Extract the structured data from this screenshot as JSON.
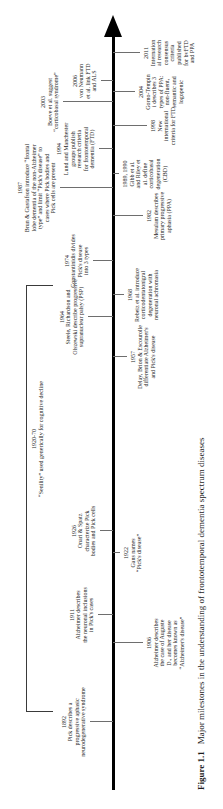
{
  "figure": {
    "caption_label": "Figure 1.1",
    "caption_text": "Major milestones in the understanding of frontotemporal dementia spectrum diseases"
  },
  "timeline": {
    "type": "timeline",
    "orientation": "vertical-arrow-up (horizontal figure rotated 90° counterclockwise)",
    "axis_color": "#000000",
    "tick_color": "#6e6e6e",
    "text_color": "#1c1c1c",
    "background_color": "#ffffff",
    "year_min": "1892",
    "year_max": "2011",
    "era": {
      "year_range": "1920-70",
      "lines": [
        "1920-70",
        "“Senility” used generically for cognitive decline"
      ],
      "bracket_x_start": 97,
      "bracket_x_end": 522,
      "label_x": 370
    },
    "events": [
      {
        "year": "1892",
        "side": "above",
        "x": 87,
        "tick": 23,
        "lines": [
          "Pick describes a",
          "progressive aphasic",
          "neurodegenerative syndrome"
        ]
      },
      {
        "year": "1906",
        "side": "below",
        "x": 166,
        "tick": 30,
        "lines": [
          "Alzheimer describes",
          "the case of Auguste",
          "D., and her disease",
          "becomes known as",
          "“Alzheimer's disease”"
        ]
      },
      {
        "year": "1911",
        "side": "above",
        "x": 194,
        "tick": 15,
        "lines": [
          "Alzheimer describes",
          "the neuronal inclusions",
          "in Pick's cases"
        ]
      },
      {
        "year": "1922",
        "side": "below",
        "x": 256,
        "tick": 7,
        "lines": [
          "Gans names",
          "“Pick's disease”"
        ]
      },
      {
        "year": "1926",
        "side": "above",
        "x": 278,
        "tick": 13,
        "lines": [
          "Onari & Spatz",
          "characterize Pick",
          "bodies and Pick cells"
        ]
      },
      {
        "year": "1957",
        "side": "below",
        "x": 452,
        "tick": 14,
        "lines": [
          "Delay, Brion & Escourolle",
          "differentiate Alzheimer's",
          "and Pick's disease"
        ]
      },
      {
        "year": "1964",
        "side": "above",
        "x": 492,
        "tick": 25,
        "lines": [
          "Steele, Richardson and",
          "Olszewski describe progressive",
          "supranuclear palsy (PSP)"
        ]
      },
      {
        "year": "1968",
        "side": "below",
        "x": 514,
        "tick": 11,
        "lines": [
          "Rebeiz et al. introduce",
          "corticodentatonigral",
          "degeneration with",
          "neuronal achromasia"
        ]
      },
      {
        "year": "1974",
        "side": "above",
        "x": 548,
        "tick": 20,
        "lines": [
          "Constantinidis divides",
          "Pick's disease",
          "into 3 types"
        ]
      },
      {
        "year": "1982",
        "side": "below",
        "x": 593,
        "tick": 30,
        "lines": [
          "Mesulam describes",
          "primary progressive",
          "aphasia (PPA)"
        ]
      },
      {
        "year": "1987",
        "side": "above",
        "x": 621,
        "tick": 53,
        "lines": [
          "Brun & Gustafson introduce “frontal",
          "lobe dementia of the non-Alzheimer",
          "type” and limit “Pick's disease” to",
          "cases where Pick bodies and",
          "Pick cells are present"
        ]
      },
      {
        "year": "1989, 1990",
        "side": "below",
        "x": 635,
        "tick": 6,
        "lines": [
          "Gibb et al.",
          "and Riley et",
          "al. define",
          "corticobasal",
          "degeneration",
          "(CBD)"
        ]
      },
      {
        "year": "1994",
        "side": "above",
        "x": 660,
        "tick": 14,
        "lines": [
          "Lund and Manchester",
          "groups publish",
          "research criteria",
          "for frontotemporal",
          "dementia (FTD)"
        ]
      },
      {
        "year": "1998",
        "side": "below",
        "x": 683,
        "tick": 34,
        "lines": [
          "New",
          "international",
          "criteria for FTD"
        ]
      },
      {
        "year": "2003",
        "side": "above",
        "x": 707,
        "tick": 50,
        "lines": [
          "Boeve et al. suggest",
          "“corticobasal syndrome”"
        ]
      },
      {
        "year": "2004",
        "side": "below",
        "x": 717,
        "tick": 22,
        "lines": [
          "Gorno-Tempin",
          "i describes 3",
          "types of PPA:",
          "non-fluent,",
          "semantic and",
          "logopenic"
        ]
      },
      {
        "year": "2006",
        "side": "above",
        "x": 728,
        "tick": 12,
        "lines": [
          "von Neumann",
          "et al. link FTD",
          "and ALS"
        ]
      },
      {
        "year": "2011",
        "side": "below",
        "x": 756,
        "tick": 27,
        "lines": [
          "Internation",
          "al research",
          "consensus",
          "criteria",
          "published",
          "for bvFTD",
          "and PPA"
        ]
      }
    ],
    "geometry": {
      "axis_y": 113,
      "axis_x_start": 19,
      "axis_x_end": 772,
      "arrow_tip_x": 794,
      "caption_x": 19,
      "caption_y": 196
    }
  }
}
